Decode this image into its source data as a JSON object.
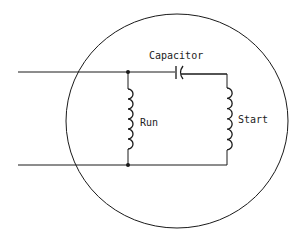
{
  "diagram": {
    "labels": {
      "capacitor": "Capacitor",
      "run": "Run",
      "start": "Start"
    },
    "components": [
      {
        "id": "capacitor",
        "type": "capacitor"
      },
      {
        "id": "run-winding",
        "type": "inductor"
      },
      {
        "id": "start-winding",
        "type": "inductor"
      }
    ],
    "colors": {
      "line": "#1a1a1a",
      "background": "#ffffff"
    }
  }
}
